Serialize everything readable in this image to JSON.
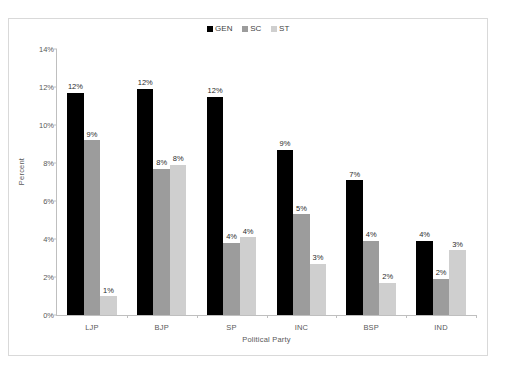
{
  "chart_data": {
    "type": "bar",
    "title": "",
    "xlabel": "Political Party",
    "ylabel": "Percent",
    "categories": [
      "LJP",
      "BJP",
      "SP",
      "INC",
      "BSP",
      "IND"
    ],
    "ylim": [
      0,
      14
    ],
    "ytick_labels": [
      "0%",
      "2%",
      "4%",
      "6%",
      "8%",
      "10%",
      "12%",
      "14%"
    ],
    "ytick_values": [
      0,
      2,
      4,
      6,
      8,
      10,
      12,
      14
    ],
    "grid": false,
    "legend_position": "top-center",
    "series": [
      {
        "name": "GEN",
        "color": "#000000",
        "values": [
          11.7,
          11.9,
          11.5,
          8.7,
          7.1,
          3.9
        ],
        "labels": [
          "12%",
          "12%",
          "12%",
          "9%",
          "7%",
          "4%"
        ]
      },
      {
        "name": "SC",
        "color": "#9c9c9c",
        "values": [
          9.2,
          7.7,
          3.8,
          5.3,
          3.9,
          1.9
        ],
        "labels": [
          "9%",
          "8%",
          "4%",
          "5%",
          "4%",
          "2%"
        ]
      },
      {
        "name": "ST",
        "color": "#cfcfcf",
        "values": [
          1.0,
          7.9,
          4.1,
          2.7,
          1.7,
          3.4
        ],
        "labels": [
          "1%",
          "8%",
          "4%",
          "3%",
          "2%",
          "3%"
        ]
      }
    ]
  }
}
